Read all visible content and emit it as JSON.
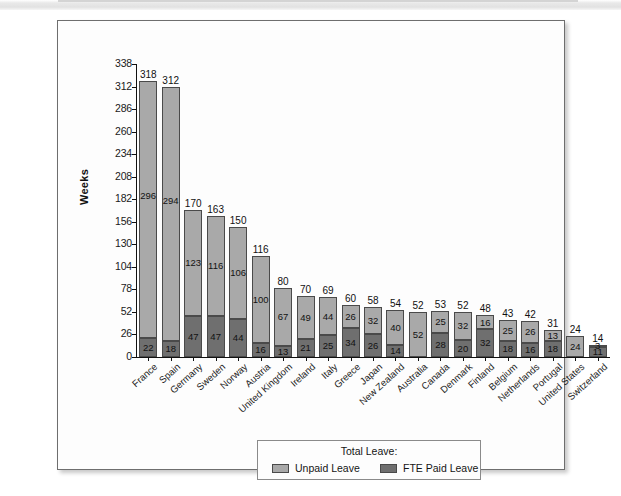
{
  "chart_data": {
    "type": "bar",
    "stacked": true,
    "title": "",
    "xlabel": "",
    "ylabel": "Weeks",
    "ylim": [
      0,
      338
    ],
    "ytick_step": 26,
    "yticks": [
      338,
      312,
      286,
      260,
      234,
      208,
      182,
      156,
      130,
      104,
      78,
      52,
      26,
      0
    ],
    "grid": false,
    "legend_position": "bottom-center",
    "legend_title": "Total Leave:",
    "categories": [
      "France",
      "Spain",
      "Germany",
      "Sweden",
      "Norway",
      "Austria",
      "United Kingdom",
      "Ireland",
      "Italy",
      "Greece",
      "Japan",
      "New Zealand",
      "Australia",
      "Canada",
      "Denmark",
      "Finland",
      "Belgium",
      "Netherlands",
      "Portugal",
      "United States",
      "Switzerland"
    ],
    "series": [
      {
        "name": "Unpaid Leave",
        "color": "#a9a9a9",
        "values": [
          296,
          294,
          123,
          116,
          106,
          100,
          67,
          49,
          44,
          26,
          32,
          40,
          52,
          25,
          32,
          16,
          25,
          26,
          13,
          24,
          3
        ]
      },
      {
        "name": "FTE Paid Leave",
        "color": "#6f6f6f",
        "values": [
          22,
          18,
          47,
          47,
          44,
          16,
          13,
          21,
          25,
          34,
          26,
          14,
          0,
          28,
          20,
          32,
          18,
          16,
          18,
          0,
          11
        ]
      }
    ],
    "totals": [
      318,
      312,
      170,
      163,
      150,
      116,
      80,
      70,
      69,
      60,
      58,
      54,
      52,
      53,
      52,
      48,
      43,
      42,
      31,
      24,
      14
    ]
  },
  "legend": {
    "title": "Total Leave:",
    "entries": [
      {
        "label": "Unpaid Leave",
        "color": "#a9a9a9"
      },
      {
        "label": "FTE Paid Leave",
        "color": "#6f6f6f"
      }
    ]
  },
  "axis": {
    "y_title": "Weeks"
  }
}
